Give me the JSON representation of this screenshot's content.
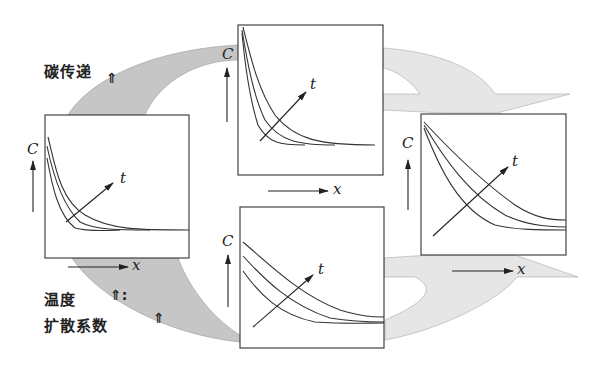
{
  "labels": {
    "carbon_transfer": "碳传递",
    "temperature": "温度",
    "diffusion_coefficient": "扩散系数",
    "up_arrow": "⇑",
    "up_arrow_colon": "⇑:"
  },
  "axes": {
    "c_label": "C",
    "x_label": "x",
    "t_label": "t"
  },
  "colors": {
    "dark_band": "#c4c4c4",
    "light_band": "#e8e8e8",
    "line": "#333333",
    "frame": "#444444"
  },
  "panels": [
    {
      "id": "left",
      "description": "Concentration profile, steep decay, baseline flat"
    },
    {
      "id": "top",
      "description": "Concentration profile, very steep decay (high carbon transfer)"
    },
    {
      "id": "bottom",
      "description": "Concentration profile, gentler decay (high temperature / diffusion)"
    },
    {
      "id": "right",
      "description": "Concentration profile, gentle decay with large penetration"
    }
  ]
}
